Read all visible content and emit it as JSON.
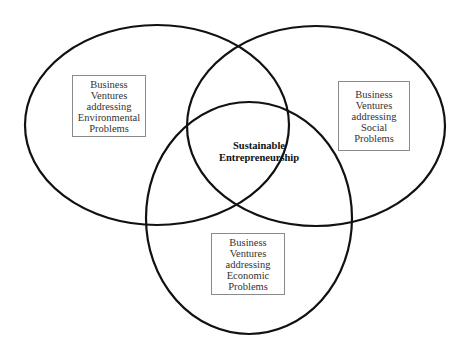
{
  "diagram": {
    "type": "venn",
    "stroke_color": "#111111",
    "circles": [
      {
        "id": "environmental",
        "label_lines": [
          "Business",
          "Ventures",
          "addressing",
          "Environmental",
          "Problems"
        ]
      },
      {
        "id": "social",
        "label_lines": [
          "Business",
          "Ventures",
          "addressing",
          "Social",
          "Problems"
        ]
      },
      {
        "id": "economic",
        "label_lines": [
          "Business",
          "Ventures",
          "addressing",
          "Economic",
          "Problems"
        ]
      }
    ],
    "intersection": {
      "label_lines": [
        "Sustainable",
        "Entrepreneurship"
      ]
    }
  }
}
